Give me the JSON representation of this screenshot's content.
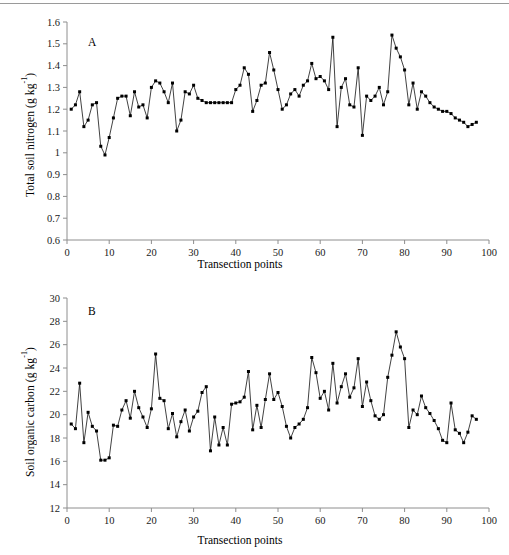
{
  "figure": {
    "panel_a_letter": "A",
    "panel_b_letter": "B",
    "x_axis_title": "Transection points",
    "panel_a_y_title_main": "Total soil nitrogen (g kg",
    "panel_a_y_title_sup": "-1",
    "panel_a_y_title_tail": ")",
    "panel_b_y_title_main": "Soil organic carbon (g kg",
    "panel_b_y_title_sup": "-1",
    "panel_b_y_title_tail": ")",
    "line_color": "#111111",
    "marker_color": "#000000",
    "axis_color": "#8e8e8e"
  },
  "chart_data": [
    {
      "type": "line",
      "panel": "A",
      "title": "",
      "xlabel": "Transection points",
      "ylabel": "Total soil nitrogen (g kg-1)",
      "xlim": [
        0,
        100
      ],
      "ylim": [
        0.6,
        1.6
      ],
      "xticks": [
        0,
        10,
        20,
        30,
        40,
        50,
        60,
        70,
        80,
        90,
        100
      ],
      "yticks": [
        0.6,
        0.7,
        0.8,
        0.9,
        1.0,
        1.1,
        1.2,
        1.3,
        1.4,
        1.5,
        1.6
      ],
      "ytick_labels": [
        "0.6",
        "0.7",
        "0.8",
        "0.9",
        "1",
        "1.1",
        "1.2",
        "1.3",
        "1.4",
        "1.5",
        "1.6"
      ],
      "xtick_labels": [
        "0",
        "10",
        "20",
        "30",
        "40",
        "50",
        "60",
        "70",
        "80",
        "90",
        "100"
      ],
      "grid": false,
      "legend": false,
      "marker": "filled-square",
      "x": [
        1,
        2,
        3,
        4,
        5,
        6,
        7,
        8,
        9,
        10,
        11,
        12,
        13,
        14,
        15,
        16,
        17,
        18,
        19,
        20,
        21,
        22,
        23,
        24,
        25,
        26,
        27,
        28,
        29,
        30,
        31,
        32,
        33,
        34,
        35,
        36,
        37,
        38,
        39,
        40,
        41,
        42,
        43,
        44,
        45,
        46,
        47,
        48,
        49,
        50,
        51,
        52,
        53,
        54,
        55,
        56,
        57,
        58,
        59,
        60,
        61,
        62,
        63,
        64,
        65,
        66,
        67,
        68,
        69,
        70,
        71,
        72,
        73,
        74,
        75,
        76,
        77,
        78,
        79,
        80,
        81,
        82,
        83,
        84,
        85,
        86,
        87,
        88,
        89,
        90,
        91,
        92,
        93,
        94,
        95,
        96,
        97
      ],
      "values": [
        1.2,
        1.22,
        1.28,
        1.12,
        1.15,
        1.22,
        1.23,
        1.03,
        0.99,
        1.07,
        1.16,
        1.25,
        1.26,
        1.26,
        1.17,
        1.28,
        1.21,
        1.22,
        1.16,
        1.3,
        1.33,
        1.32,
        1.28,
        1.23,
        1.32,
        1.1,
        1.15,
        1.28,
        1.27,
        1.31,
        1.25,
        1.24,
        1.23,
        1.23,
        1.23,
        1.23,
        1.23,
        1.23,
        1.23,
        1.29,
        1.31,
        1.39,
        1.36,
        1.19,
        1.24,
        1.31,
        1.32,
        1.46,
        1.38,
        1.29,
        1.2,
        1.22,
        1.27,
        1.29,
        1.26,
        1.31,
        1.33,
        1.41,
        1.34,
        1.35,
        1.33,
        1.29,
        1.53,
        1.12,
        1.3,
        1.34,
        1.22,
        1.21,
        1.39,
        1.08,
        1.26,
        1.24,
        1.26,
        1.3,
        1.22,
        1.28,
        1.54,
        1.48,
        1.44,
        1.38,
        1.22,
        1.32,
        1.2,
        1.28,
        1.26,
        1.23,
        1.21,
        1.2,
        1.19,
        1.19,
        1.18,
        1.16,
        1.15,
        1.14,
        1.12,
        1.13,
        1.14
      ]
    },
    {
      "type": "line",
      "panel": "B",
      "title": "",
      "xlabel": "Transection points",
      "ylabel": "Soil organic carbon (g kg-1)",
      "xlim": [
        0,
        100
      ],
      "ylim": [
        12,
        30
      ],
      "xticks": [
        0,
        10,
        20,
        30,
        40,
        50,
        60,
        70,
        80,
        90,
        100
      ],
      "yticks": [
        12,
        14,
        16,
        18,
        20,
        22,
        24,
        26,
        28,
        30
      ],
      "ytick_labels": [
        "12",
        "14",
        "16",
        "18",
        "20",
        "22",
        "24",
        "26",
        "28",
        "30"
      ],
      "xtick_labels": [
        "0",
        "10",
        "20",
        "30",
        "40",
        "50",
        "60",
        "70",
        "80",
        "90",
        "100"
      ],
      "grid": false,
      "legend": false,
      "marker": "filled-square",
      "x": [
        1,
        2,
        3,
        4,
        5,
        6,
        7,
        8,
        9,
        10,
        11,
        12,
        13,
        14,
        15,
        16,
        17,
        18,
        19,
        20,
        21,
        22,
        23,
        24,
        25,
        26,
        27,
        28,
        29,
        30,
        31,
        32,
        33,
        34,
        35,
        36,
        37,
        38,
        39,
        40,
        41,
        42,
        43,
        44,
        45,
        46,
        47,
        48,
        49,
        50,
        51,
        52,
        53,
        54,
        55,
        56,
        57,
        58,
        59,
        60,
        61,
        62,
        63,
        64,
        65,
        66,
        67,
        68,
        69,
        70,
        71,
        72,
        73,
        74,
        75,
        76,
        77,
        78,
        79,
        80,
        81,
        82,
        83,
        84,
        85,
        86,
        87,
        88,
        89,
        90,
        91,
        92,
        93,
        94,
        95,
        96,
        97
      ],
      "values": [
        19.2,
        18.8,
        22.7,
        17.6,
        20.2,
        19.0,
        18.6,
        16.1,
        16.1,
        16.3,
        19.1,
        19.0,
        20.4,
        21.2,
        19.7,
        22.0,
        20.6,
        19.8,
        18.9,
        20.5,
        25.2,
        21.4,
        21.2,
        18.8,
        20.1,
        18.1,
        19.4,
        20.4,
        18.6,
        19.8,
        20.3,
        21.9,
        22.4,
        16.9,
        19.8,
        17.4,
        18.9,
        17.4,
        20.9,
        21.0,
        21.1,
        21.5,
        23.7,
        18.7,
        20.8,
        18.9,
        21.3,
        23.5,
        21.3,
        21.9,
        20.7,
        19.0,
        18.0,
        18.9,
        19.2,
        19.6,
        20.6,
        24.9,
        23.6,
        21.4,
        22.0,
        20.4,
        24.4,
        21.0,
        22.4,
        23.5,
        21.5,
        22.3,
        24.8,
        20.7,
        22.8,
        21.2,
        19.9,
        19.6,
        20.0,
        23.2,
        25.1,
        27.1,
        25.8,
        24.8,
        18.9,
        20.4,
        20.0,
        21.6,
        20.6,
        20.1,
        19.5,
        18.8,
        17.8,
        17.6,
        21.0,
        18.7,
        18.4,
        17.6,
        18.5,
        19.9,
        19.6
      ]
    }
  ]
}
